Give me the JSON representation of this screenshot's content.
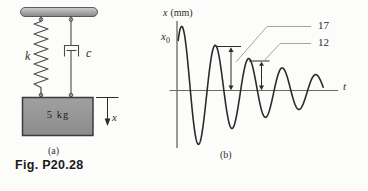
{
  "figure_label": "Fig. P20.28",
  "panel_a": {
    "caption": "(a)",
    "spring_label": "k",
    "damper_label": "c",
    "mass_label": "5 kg",
    "displacement_var": "x"
  },
  "panel_b": {
    "caption": "(b)",
    "y_axis_var": "x",
    "y_axis_unit": "(mm)",
    "initial_var": "x",
    "initial_sub": "0",
    "t_axis_var": "t",
    "peak_label_1": "17",
    "peak_label_2": "12"
  },
  "colors": {
    "ink": "#2b2b2b",
    "axis": "#5f5f5f",
    "leader": "#9a9a9a",
    "line_art": "#4a4a4a",
    "block_fill": "#979797",
    "block_border": "#3b3b3b"
  },
  "chart_data": {
    "type": "line",
    "xlabel": "t",
    "ylabel": "x (mm)",
    "y_start_label": "x0",
    "legend": [],
    "grid": false,
    "annotated_peak_values_mm": [
      17,
      12
    ],
    "annotations": [
      {
        "label": "17",
        "meaning": "height of 2nd positive peak above t-axis, mm"
      },
      {
        "label": "12",
        "meaning": "height of 3rd positive peak above t-axis, mm"
      }
    ],
    "curve_params": {
      "axis_x_px": 177,
      "axis_y_px": 90.5,
      "first_peak_x_px": 182,
      "first_peak_amp_px": 64,
      "period_px": 33.5,
      "decay_ratio_per_period": 1.4167,
      "phase_start_rad": -0.72,
      "phase_end_rad": 26.5,
      "step_rad": 0.05
    }
  }
}
